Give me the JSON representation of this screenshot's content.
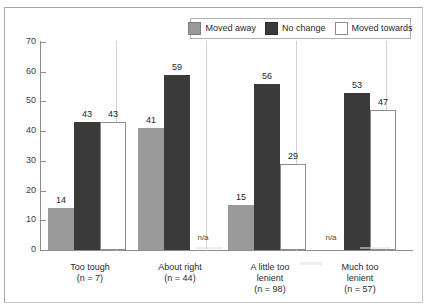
{
  "figure": {
    "frame": true,
    "background": "#ffffff"
  },
  "chart_data": {
    "type": "bar",
    "title": "",
    "subtitle": "",
    "xlabel": "",
    "ylabel": "",
    "ylim": [
      0,
      70
    ],
    "yticks": [
      0,
      10,
      20,
      30,
      40,
      50,
      60,
      70
    ],
    "ytick_labels": [
      "0",
      "10",
      "20",
      "30",
      "40",
      "50",
      "60",
      "70"
    ],
    "grid": false,
    "legend_position": "top-right",
    "categories": [
      "Too tough",
      "About right",
      "A little too lenient",
      "Much too lenient"
    ],
    "category_lines": [
      [
        "Too tough",
        "(n = 7)"
      ],
      [
        "About right",
        "(n = 44)"
      ],
      [
        "A little too",
        "lenient",
        "(n = 98)"
      ],
      [
        "Much too",
        "lenient",
        "(n = 57)"
      ]
    ],
    "category_counts": [
      7,
      44,
      98,
      57
    ],
    "series": [
      {
        "name": "Moved away",
        "color": "#9a9a9a",
        "values": [
          14,
          41,
          15,
          null
        ],
        "labels": [
          "14",
          "41",
          "15",
          "n/a"
        ]
      },
      {
        "name": "No change",
        "color": "#3a3a3a",
        "values": [
          43,
          59,
          56,
          53
        ],
        "labels": [
          "43",
          "59",
          "56",
          "53"
        ]
      },
      {
        "name": "Moved towards",
        "color": "#ffffff",
        "values": [
          43,
          null,
          29,
          47
        ],
        "labels": [
          "43",
          "n/a",
          "29",
          "47"
        ]
      }
    ],
    "missing_marker": "n/a"
  },
  "legend": {
    "items": [
      {
        "label": "Moved away",
        "color": "#9a9a9a"
      },
      {
        "label": "No change",
        "color": "#3a3a3a"
      },
      {
        "label": "Moved towards",
        "color": "#ffffff"
      }
    ]
  },
  "colors": {
    "moved_away": "#9a9a9a",
    "no_change": "#3a3a3a",
    "moved_towards": "#ffffff",
    "axis": "#8e8e8e",
    "separator": "#d2d2d2",
    "frame": "#a6a6a6",
    "text": "#2b2b2b"
  }
}
